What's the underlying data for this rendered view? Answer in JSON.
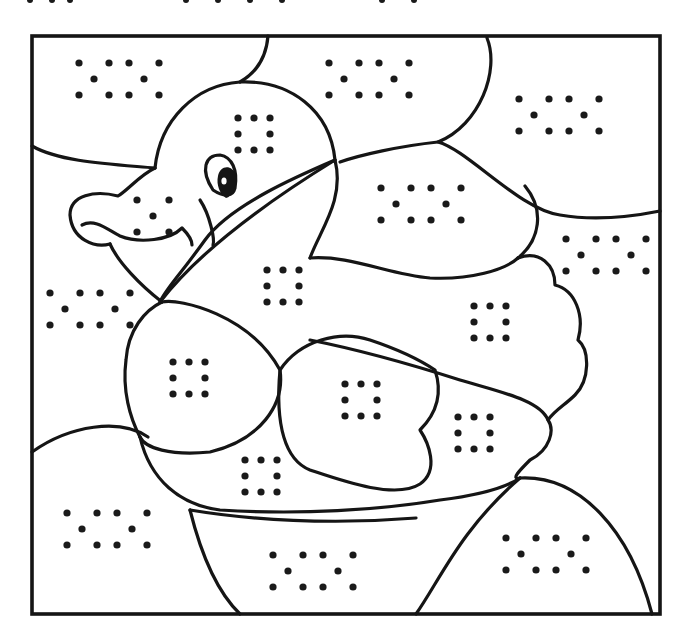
{
  "page": {
    "title": "",
    "colors": {
      "ink": "#151515",
      "paper": "#ffffff"
    }
  },
  "frame": {
    "x": 32,
    "y": 36,
    "width": 628,
    "height": 578
  },
  "top_partial_dots": [
    {
      "x": 30,
      "y": 0
    },
    {
      "x": 52,
      "y": 0
    },
    {
      "x": 70,
      "y": 0
    },
    {
      "x": 186,
      "y": 0
    },
    {
      "x": 218,
      "y": 0
    },
    {
      "x": 250,
      "y": 0
    },
    {
      "x": 282,
      "y": 0
    },
    {
      "x": 382,
      "y": 0
    },
    {
      "x": 414,
      "y": 0
    }
  ],
  "dot_patterns": [
    {
      "name": "sky-top-left",
      "type": "wave",
      "x": 79,
      "y": 63
    },
    {
      "name": "sky-top-center",
      "type": "wave",
      "x": 329,
      "y": 63
    },
    {
      "name": "sky-top-right",
      "type": "wave",
      "x": 519,
      "y": 99
    },
    {
      "name": "head",
      "type": "square",
      "x": 238,
      "y": 118
    },
    {
      "name": "beak",
      "type": "x",
      "x": 137,
      "y": 200
    },
    {
      "name": "sky-mid-center",
      "type": "wave",
      "x": 381,
      "y": 188
    },
    {
      "name": "sky-mid-right",
      "type": "wave",
      "x": 566,
      "y": 239
    },
    {
      "name": "neck-body",
      "type": "square",
      "x": 267,
      "y": 270
    },
    {
      "name": "sky-left",
      "type": "wave",
      "x": 50,
      "y": 293
    },
    {
      "name": "back-wing",
      "type": "square",
      "x": 474,
      "y": 306
    },
    {
      "name": "front-body",
      "type": "square",
      "x": 173,
      "y": 362
    },
    {
      "name": "front-wing",
      "type": "square",
      "x": 345,
      "y": 384
    },
    {
      "name": "wing-tip",
      "type": "square",
      "x": 458,
      "y": 417
    },
    {
      "name": "belly",
      "type": "square",
      "x": 245,
      "y": 460
    },
    {
      "name": "water-left",
      "type": "wave",
      "x": 67,
      "y": 513
    },
    {
      "name": "water-center",
      "type": "wave",
      "x": 273,
      "y": 555
    },
    {
      "name": "water-right",
      "type": "wave",
      "x": 506,
      "y": 538
    }
  ]
}
